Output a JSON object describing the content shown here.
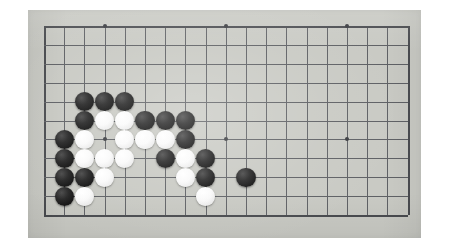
{
  "scene": {
    "type": "photograph",
    "subject": "go-board",
    "background_color": "#ffffff",
    "board_color": "#c9cac4",
    "grid_line_color": "#5f6165",
    "edge_line_color": "#4a4c50",
    "black_stone_color": "#141414",
    "white_stone_color": "#f5f5f3",
    "caption": "Go board with black and white stones in the lower-left region"
  },
  "board_photo": {
    "left": 28,
    "top": 10,
    "width": 393,
    "height": 228
  },
  "grid": {
    "origin_x": 44,
    "origin_y": 26,
    "spacing_x": 20.2,
    "spacing_y": 18.9,
    "columns": 19,
    "rows": 11,
    "visible_columns_label": "19",
    "visible_rows_label": "11"
  },
  "star_points": [
    {
      "col": 4,
      "row": 1
    },
    {
      "col": 10,
      "row": 1
    },
    {
      "col": 16,
      "row": 1
    },
    {
      "col": 4,
      "row": 7
    },
    {
      "col": 10,
      "row": 7
    },
    {
      "col": 16,
      "row": 7
    }
  ],
  "stone_radius": 9.6,
  "stones": [
    {
      "col": 3,
      "row": 5,
      "color": "black"
    },
    {
      "col": 4,
      "row": 5,
      "color": "black"
    },
    {
      "col": 5,
      "row": 5,
      "color": "black"
    },
    {
      "col": 3,
      "row": 6,
      "color": "black"
    },
    {
      "col": 4,
      "row": 6,
      "color": "white"
    },
    {
      "col": 5,
      "row": 6,
      "color": "white"
    },
    {
      "col": 6,
      "row": 6,
      "color": "black"
    },
    {
      "col": 7,
      "row": 6,
      "color": "black"
    },
    {
      "col": 8,
      "row": 6,
      "color": "black"
    },
    {
      "col": 2,
      "row": 7,
      "color": "black"
    },
    {
      "col": 3,
      "row": 7,
      "color": "white"
    },
    {
      "col": 5,
      "row": 7,
      "color": "white"
    },
    {
      "col": 6,
      "row": 7,
      "color": "white"
    },
    {
      "col": 7,
      "row": 7,
      "color": "white"
    },
    {
      "col": 8,
      "row": 7,
      "color": "black"
    },
    {
      "col": 2,
      "row": 8,
      "color": "black"
    },
    {
      "col": 3,
      "row": 8,
      "color": "white"
    },
    {
      "col": 4,
      "row": 8,
      "color": "white"
    },
    {
      "col": 5,
      "row": 8,
      "color": "white"
    },
    {
      "col": 7,
      "row": 8,
      "color": "black"
    },
    {
      "col": 8,
      "row": 8,
      "color": "white"
    },
    {
      "col": 9,
      "row": 8,
      "color": "black"
    },
    {
      "col": 2,
      "row": 9,
      "color": "black"
    },
    {
      "col": 3,
      "row": 9,
      "color": "black"
    },
    {
      "col": 4,
      "row": 9,
      "color": "white"
    },
    {
      "col": 8,
      "row": 9,
      "color": "white"
    },
    {
      "col": 9,
      "row": 9,
      "color": "black"
    },
    {
      "col": 11,
      "row": 9,
      "color": "black"
    },
    {
      "col": 2,
      "row": 10,
      "color": "black"
    },
    {
      "col": 3,
      "row": 10,
      "color": "white"
    },
    {
      "col": 9,
      "row": 10,
      "color": "white"
    }
  ],
  "counts": {
    "black_stones": 18,
    "white_stones": 13,
    "total_stones": 31
  }
}
